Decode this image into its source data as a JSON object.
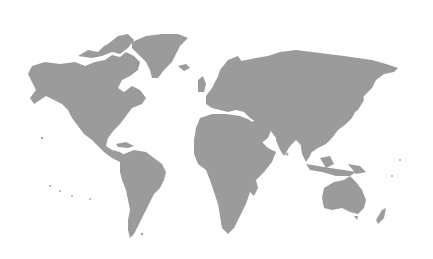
{
  "map": {
    "type": "world-silhouette",
    "background_color": "#ffffff",
    "land_color": "#9b9b9b",
    "regions": [
      "north-america",
      "greenland",
      "south-america",
      "europe",
      "africa",
      "asia",
      "australia",
      "new-zealand"
    ]
  }
}
